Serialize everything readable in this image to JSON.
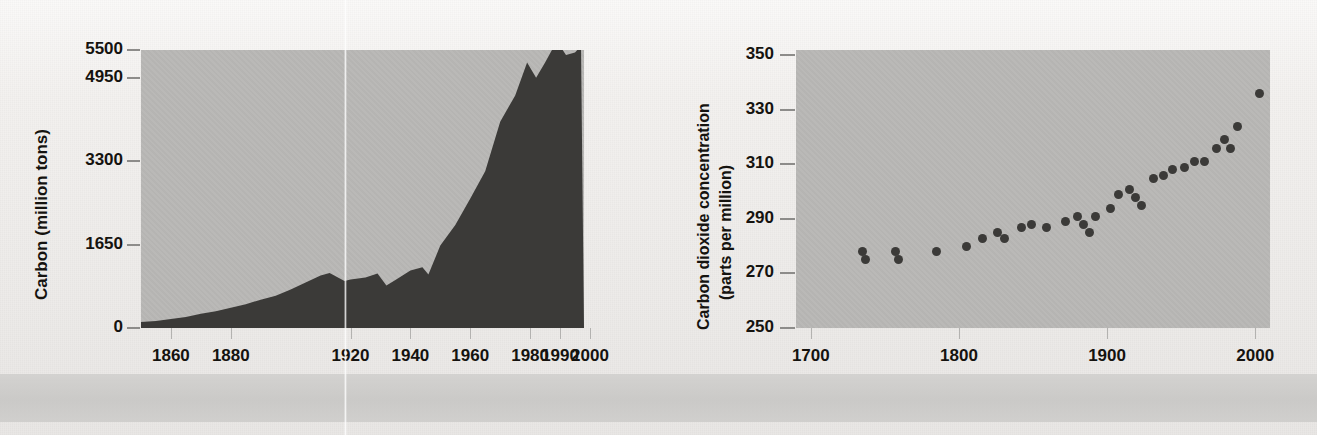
{
  "figure": {
    "background_color": "#f3f1ef",
    "panel_color": "#b9b8b6",
    "ink_color": "#15130f",
    "series_color": "#3b3a38"
  },
  "chart_data": [
    {
      "id": "carbon-emissions",
      "type": "area",
      "title": "",
      "xlabel": "",
      "ylabel": "Carbon (million tons)",
      "xlim": [
        1850,
        1998
      ],
      "ylim": [
        0,
        5500
      ],
      "xticks": [
        1860,
        1880,
        1990,
        1920,
        1940,
        1960,
        1980,
        2000
      ],
      "xticklabels": [
        "1860",
        "1880",
        "1990",
        "1920",
        "1940",
        "1960",
        "1980",
        "2000"
      ],
      "yticks": [
        0,
        1650,
        3300,
        4950,
        5500
      ],
      "yticklabels": [
        "0",
        "1650",
        "3300",
        "4950",
        "5500"
      ],
      "grid": false,
      "legend": "none",
      "note": "Third x tick label reads 1990 in the original print (typographic error for 1900).",
      "x": [
        1850,
        1855,
        1860,
        1865,
        1870,
        1875,
        1880,
        1885,
        1890,
        1895,
        1900,
        1905,
        1910,
        1913,
        1918,
        1920,
        1925,
        1929,
        1932,
        1935,
        1940,
        1944,
        1946,
        1950,
        1955,
        1960,
        1965,
        1970,
        1975,
        1979,
        1982,
        1985,
        1988,
        1990,
        1992,
        1995,
        1997
      ],
      "y": [
        120,
        140,
        180,
        220,
        280,
        330,
        400,
        470,
        560,
        640,
        760,
        900,
        1040,
        1090,
        930,
        960,
        1000,
        1080,
        840,
        950,
        1140,
        1200,
        1060,
        1630,
        2040,
        2560,
        3100,
        4080,
        4600,
        5250,
        4950,
        5250,
        5800,
        5920,
        5400,
        5450,
        6400
      ]
    },
    {
      "id": "co2-concentration",
      "type": "scatter",
      "title": "",
      "xlabel": "",
      "ylabel": "Carbon dioxide concentration (parts per million)",
      "ylabel_lines": [
        "Carbon dioxide concentration",
        "(parts per million)"
      ],
      "xlim": [
        1690,
        2010
      ],
      "ylim": [
        250,
        352
      ],
      "xticks": [
        1700,
        1800,
        1900,
        2000
      ],
      "xticklabels": [
        "1700",
        "1800",
        "1900",
        "2000"
      ],
      "yticks": [
        250,
        270,
        290,
        310,
        330,
        350
      ],
      "yticklabels": [
        "250",
        "270",
        "290",
        "310",
        "330",
        "350"
      ],
      "grid": false,
      "legend": "none",
      "points": [
        [
          1735,
          278
        ],
        [
          1737,
          275
        ],
        [
          1757,
          278
        ],
        [
          1759,
          275
        ],
        [
          1785,
          278
        ],
        [
          1805,
          280
        ],
        [
          1816,
          283
        ],
        [
          1826,
          285
        ],
        [
          1831,
          283
        ],
        [
          1842,
          287
        ],
        [
          1849,
          288
        ],
        [
          1859,
          287
        ],
        [
          1872,
          289
        ],
        [
          1880,
          291
        ],
        [
          1884,
          288
        ],
        [
          1888,
          285
        ],
        [
          1892,
          291
        ],
        [
          1902,
          294
        ],
        [
          1908,
          299
        ],
        [
          1915,
          301
        ],
        [
          1919,
          298
        ],
        [
          1923,
          295
        ],
        [
          1931,
          305
        ],
        [
          1938,
          306
        ],
        [
          1944,
          308
        ],
        [
          1952,
          309
        ],
        [
          1959,
          311
        ],
        [
          1966,
          311
        ],
        [
          1974,
          316
        ],
        [
          1979,
          319
        ],
        [
          1983,
          316
        ],
        [
          1988,
          324
        ],
        [
          2003,
          336
        ]
      ]
    }
  ]
}
